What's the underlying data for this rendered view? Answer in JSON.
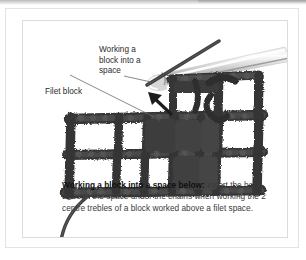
{
  "figure": {
    "kind": "crochet-technique-photo-illustration",
    "callouts": [
      {
        "id": "working-a-block-into-a-space",
        "text": "Working a\nblock into a\nspace",
        "leader": "line from label to crochet hook tip"
      },
      {
        "id": "filet-block",
        "text": "Filet block",
        "leader": "line from label to solid block of the mesh"
      }
    ],
    "arrow": {
      "id": "insertion-arrow",
      "direction": "up-left",
      "meaning": "hook insertion point under the chain space"
    },
    "hook": {
      "id": "crochet-hook",
      "color": "#c9c9c9",
      "orientation": "diagonal, tip pointing down-left"
    },
    "yarn_color": "#3a3a3a",
    "background_color": "#ffffff"
  },
  "caption": {
    "lead": "Working a block into a space below:",
    "body": " Insert the hook through the space under the chains when working the 2 centre trebles of a block worked above a filet space."
  }
}
